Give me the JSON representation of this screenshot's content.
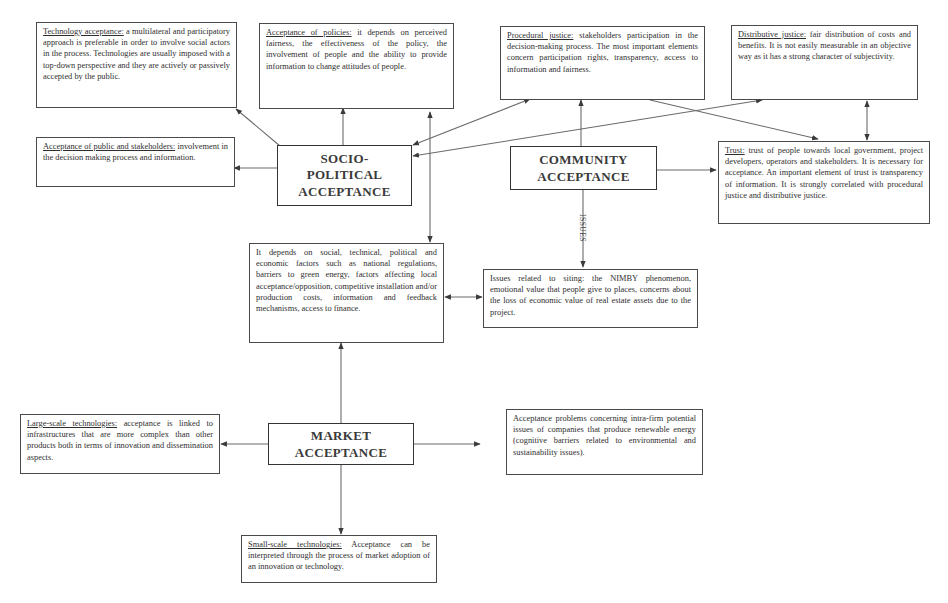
{
  "diagram": {
    "type": "flowchart",
    "main_nodes": {
      "socio_political": {
        "lines": [
          "SOCIO-",
          "POLITICAL",
          "ACCEPTANCE"
        ]
      },
      "community": {
        "lines": [
          "COMMUNITY",
          "ACCEPTANCE"
        ]
      },
      "market": {
        "lines": [
          "MARKET",
          "ACCEPTANCE"
        ]
      }
    },
    "boxes": {
      "technology_acceptance": {
        "term": "Technology acceptance:",
        "text": " a multilateral and participatory approach is preferable in order to involve social actors in the process. Technologies are usually imposed with a top-down perspective and they are actively or passively accepted by the public."
      },
      "acceptance_of_policies": {
        "term": "Acceptance of policies:",
        "text": " it depends on perceived fairness, the effectiveness of the policy, the involvement of people and the ability to provide information to change attitudes of people."
      },
      "procedural_justice": {
        "term": "Procedural justice:",
        "text": " stakeholders participation in the decision-making process. The most important elements concern participation rights, transparency, access to information and fairness."
      },
      "distributive_justice": {
        "term": "Distributive justice:",
        "text": " fair distribution of costs and benefits. It is not easily measurable in an objective way as it has a strong character of subjectivity."
      },
      "acceptance_public_stakeholders": {
        "term": "Acceptance of public and stakeholders:",
        "text": " involvement in the decision making process and information."
      },
      "trust": {
        "term": "Trust:",
        "text": " trust of people towards local government, project developers, operators and stakeholders. It is necessary for acceptance. An important element of trust is transparency of information. It is strongly correlated with procedural justice and distributive justice."
      },
      "factors": {
        "term": "",
        "text": "It depends on social, technical, political and economic factors such as national regulations, barriers to green energy, factors affecting local acceptance/opposition, competitive installation and/or production costs, information and feedback mechanisms, access to finance."
      },
      "siting_issues": {
        "term": "",
        "text": "Issues related to siting: the NIMBY phenomenon, emotional value that people give to places, concerns about the loss of economic value of real estate assets due to the project."
      },
      "large_scale": {
        "term": "Large-scale technologies:",
        "text": " acceptance is linked to infrastructures that are more complex than other products both in terms of innovation and dissemination aspects."
      },
      "intra_firm": {
        "term": "",
        "text": "Acceptance problems concerning intra-firm potential issues of companies that produce renewable energy (cognitive barriers related to environmental and sustainability issues)."
      },
      "small_scale": {
        "term": "Small-scale technologies:",
        "text": " Acceptance can be interpreted through the process of market adoption of an innovation or technology."
      }
    },
    "edge_labels": {
      "issues": "ISSUES"
    },
    "edges": [
      {
        "from": "socio_political",
        "to": "technology_acceptance",
        "type": "arrow"
      },
      {
        "from": "socio_political",
        "to": "acceptance_of_policies",
        "type": "arrow"
      },
      {
        "from": "socio_political",
        "to": "acceptance_public_stakeholders",
        "type": "arrow"
      },
      {
        "from": "socio_political",
        "to": "procedural_justice",
        "type": "bidirectional"
      },
      {
        "from": "socio_political",
        "to": "distributive_justice",
        "type": "bidirectional"
      },
      {
        "from": "acceptance_of_policies",
        "to": "factors",
        "type": "bidirectional"
      },
      {
        "from": "community",
        "to": "procedural_justice",
        "type": "arrow"
      },
      {
        "from": "community",
        "to": "trust",
        "type": "arrow"
      },
      {
        "from": "community",
        "to": "siting_issues",
        "type": "arrow",
        "label": "ISSUES"
      },
      {
        "from": "procedural_justice",
        "to": "trust",
        "type": "arrow"
      },
      {
        "from": "distributive_justice",
        "to": "trust",
        "type": "bidirectional"
      },
      {
        "from": "factors",
        "to": "siting_issues",
        "type": "bidirectional"
      },
      {
        "from": "market",
        "to": "factors",
        "type": "arrow"
      },
      {
        "from": "market",
        "to": "large_scale",
        "type": "arrow"
      },
      {
        "from": "market",
        "to": "intra_firm",
        "type": "arrow"
      },
      {
        "from": "market",
        "to": "small_scale",
        "type": "arrow"
      }
    ],
    "colors": {
      "box_border": "#4a4a4a",
      "line": "#6a6a6a",
      "text": "#2e2e2e"
    }
  }
}
